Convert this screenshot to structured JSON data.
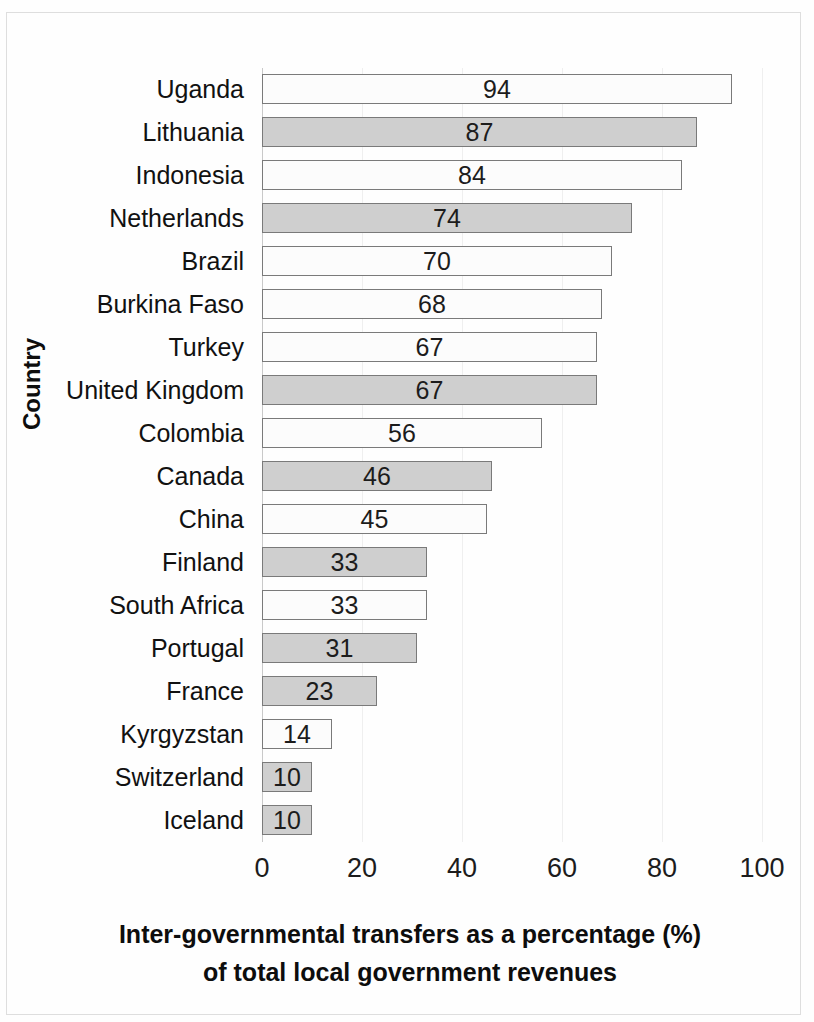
{
  "chart_data": {
    "type": "bar",
    "orientation": "horizontal",
    "title": "",
    "xlabel_line1": "Inter-governmental transfers as a percentage (%)",
    "xlabel_line2": "of  total local government revenues",
    "ylabel": "Country",
    "xlim": [
      0,
      100
    ],
    "xticks": [
      0,
      20,
      40,
      60,
      80,
      100
    ],
    "xtick_labels": [
      "0",
      "20",
      "40",
      "60",
      "80",
      "100"
    ],
    "grid": true,
    "legend": "none",
    "categories": [
      "Uganda",
      "Lithuania",
      "Indonesia",
      "Netherlands",
      "Brazil",
      "Burkina Faso",
      "Turkey",
      "United Kingdom",
      "Colombia",
      "Canada",
      "China",
      "Finland",
      "South Africa",
      "Portugal",
      "France",
      "Kyrgyzstan",
      "Switzerland",
      "Iceland"
    ],
    "values": [
      94,
      87,
      84,
      74,
      70,
      68,
      67,
      67,
      56,
      46,
      45,
      33,
      33,
      31,
      23,
      14,
      10,
      10
    ],
    "value_labels": [
      "94",
      "87",
      "84",
      "74",
      "70",
      "68",
      "67",
      "67",
      "56",
      "46",
      "45",
      "33",
      "33",
      "31",
      "23",
      "14",
      "10",
      "10"
    ],
    "bar_fills": [
      "white",
      "gray",
      "white",
      "gray",
      "white",
      "white",
      "white",
      "gray",
      "white",
      "gray",
      "white",
      "gray",
      "white",
      "gray",
      "gray",
      "white",
      "gray",
      "gray"
    ],
    "colors": {
      "bar_white": "#fcfcfc",
      "bar_gray": "#cfcfcf",
      "bar_border": "#7a7a7a",
      "gridline": "#efefef",
      "text": "#1c1c1c",
      "background": "#fefefe",
      "frame": "#dedede"
    }
  }
}
